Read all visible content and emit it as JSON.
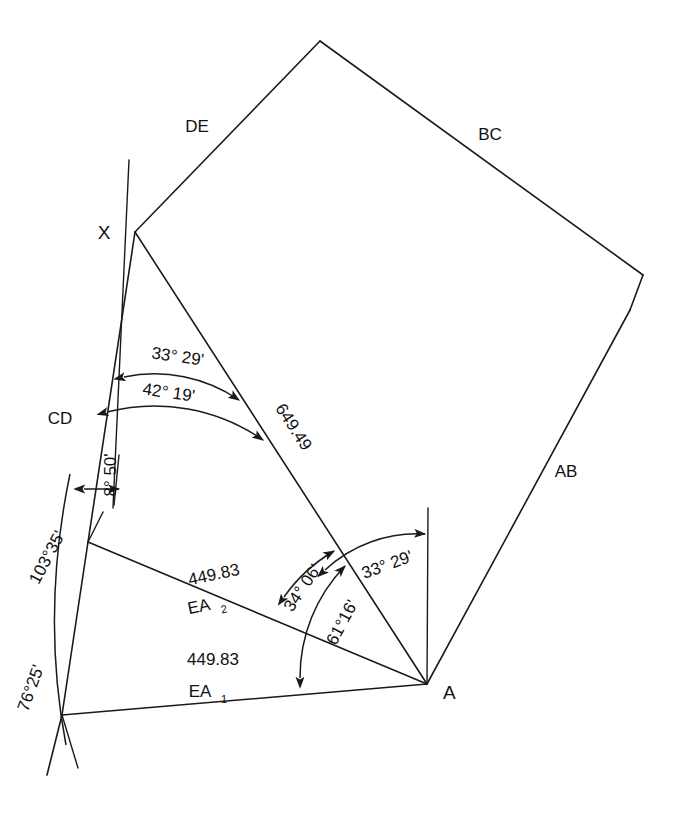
{
  "diagram": {
    "background_color": "#ffffff",
    "line_color": "#1a1a1a",
    "points": {
      "x_label": "X",
      "a_label": "A"
    },
    "side_labels": {
      "de": "DE",
      "bc": "BC",
      "ab": "AB",
      "cd": "CD"
    },
    "distances": {
      "xa": "649.49",
      "e2a": "449.83",
      "e1a": "449.83"
    },
    "leg_labels": {
      "ea2_base": "EA",
      "ea2_sub": "2",
      "ea1_base": "EA",
      "ea1_sub": "1"
    },
    "angles": {
      "x_upper": "33° 29'",
      "x_lower": "42° 19'",
      "x_deflect": "8° 50'",
      "e2": "103°35'",
      "e1": "76°25'",
      "a_outer": "34° 06'",
      "a_mid": "61°16'",
      "a_inner": "33° 29'"
    }
  }
}
